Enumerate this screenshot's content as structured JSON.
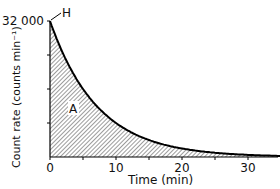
{
  "chart_data": {
    "type": "area",
    "title": "",
    "xlabel": "Time (min)",
    "ylabel": "Count rate (counts min⁻¹)",
    "x_ticks": [
      0,
      10,
      20,
      30
    ],
    "x_minor_ticks": [
      5,
      15,
      25
    ],
    "y_tick_label": "32 000",
    "y_ticks": [
      8000,
      16000,
      24000,
      32000
    ],
    "xlim": [
      0,
      35
    ],
    "ylim": [
      0,
      32000
    ],
    "grid": false,
    "series": [
      {
        "name": "Decay curve",
        "x": [
          0,
          2,
          4,
          5,
          6,
          8,
          10,
          12,
          15,
          20,
          25,
          30,
          35
        ],
        "values": [
          32000,
          24300,
          18400,
          16000,
          14000,
          10600,
          8000,
          6100,
          4000,
          2000,
          1000,
          500,
          250
        ]
      }
    ],
    "annotations": [
      {
        "text": "H",
        "at": [
          0,
          32000
        ],
        "note": "initial count rate marker"
      },
      {
        "text": "A",
        "note": "shaded area under curve"
      }
    ]
  }
}
